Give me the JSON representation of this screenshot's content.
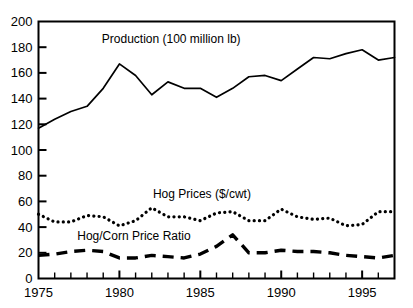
{
  "chart_data": {
    "type": "line",
    "title": "",
    "xlabel": "",
    "ylabel": "",
    "xlim": [
      1975,
      1997
    ],
    "ylim": [
      0,
      200
    ],
    "grid": false,
    "legend_position": "inline-annotations",
    "x": [
      1975,
      1976,
      1977,
      1978,
      1979,
      1980,
      1981,
      1982,
      1983,
      1984,
      1985,
      1986,
      1987,
      1988,
      1989,
      1990,
      1991,
      1992,
      1993,
      1994,
      1995,
      1996,
      1997
    ],
    "xticks": [
      1975,
      1976,
      1977,
      1978,
      1979,
      1980,
      1981,
      1982,
      1983,
      1984,
      1985,
      1986,
      1987,
      1988,
      1989,
      1990,
      1991,
      1992,
      1993,
      1994,
      1995,
      1996,
      1997
    ],
    "xticklabels": [
      "1975",
      "",
      "",
      "",
      "",
      "1980",
      "",
      "",
      "",
      "",
      "1985",
      "",
      "",
      "",
      "",
      "1990",
      "",
      "",
      "",
      "",
      "1995",
      "",
      ""
    ],
    "xtick_labels_shown": [
      "1975",
      "1980",
      "1985",
      "1990",
      "1995"
    ],
    "yticks": [
      0,
      20,
      40,
      60,
      80,
      100,
      120,
      140,
      160,
      180,
      200
    ],
    "yticklabels": [
      "0",
      "20",
      "40",
      "60",
      "80",
      "100",
      "120",
      "140",
      "160",
      "180",
      "200"
    ],
    "series": [
      {
        "name": "Production (100 million lb)",
        "style": "solid",
        "label_x": 1983.2,
        "label_y": 183,
        "values": [
          117,
          124,
          130,
          134,
          148,
          167,
          158,
          143,
          153,
          148,
          148,
          141,
          148,
          157,
          158,
          154,
          163,
          172,
          171,
          175,
          178,
          170,
          172
        ]
      },
      {
        "name": "Hog Prices ($/cwt)",
        "style": "dotted",
        "label_x": 1985.1,
        "label_y": 63,
        "values": [
          50,
          44,
          44,
          49,
          48,
          41,
          45,
          55,
          48,
          48,
          45,
          51,
          52,
          45,
          45,
          54,
          48,
          46,
          47,
          41,
          42,
          52,
          52
        ]
      },
      {
        "name": "Hog/Corn Price Ratio",
        "style": "dashed",
        "label_x": 1980.9,
        "label_y": 30,
        "values": [
          18,
          19,
          21,
          22,
          21,
          16,
          16,
          18,
          17,
          16,
          19,
          25,
          34,
          20,
          20,
          22,
          21,
          21,
          20,
          18,
          17,
          16,
          18
        ]
      }
    ]
  },
  "axes": {
    "y_axis_name": "value-axis",
    "x_axis_name": "year-axis"
  }
}
